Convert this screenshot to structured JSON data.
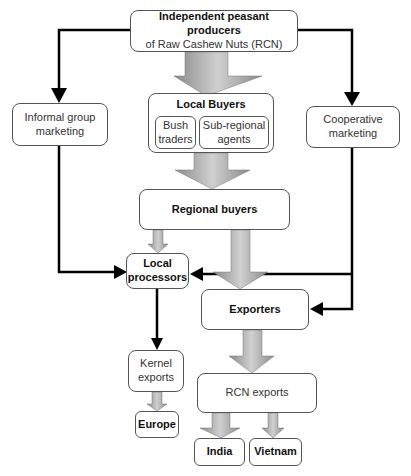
{
  "diagram": {
    "type": "flowchart",
    "nodes": {
      "producers": {
        "line1": "Independent peasant producers",
        "line2": "of Raw Cashew Nuts (RCN)"
      },
      "informal": {
        "label": "Informal group marketing"
      },
      "cooperative": {
        "label": "Cooperative marketing"
      },
      "local_buyers": {
        "label": "Local Buyers",
        "bush": "Bush traders",
        "subregional": "Sub-regional agents"
      },
      "regional_buyers": {
        "label": "Regional buyers"
      },
      "local_processors": {
        "label": "Local processors"
      },
      "exporters": {
        "label": "Exporters"
      },
      "kernel_exports": {
        "label": "Kernel exports"
      },
      "europe": {
        "label": "Europe"
      },
      "rcn_exports": {
        "label": "RCN exports"
      },
      "india": {
        "label": "India"
      },
      "vietnam": {
        "label": "Vietnam"
      }
    },
    "edges": [
      [
        "producers",
        "informal"
      ],
      [
        "producers",
        "cooperative"
      ],
      [
        "producers",
        "local_buyers"
      ],
      [
        "local_buyers",
        "regional_buyers"
      ],
      [
        "regional_buyers",
        "local_processors"
      ],
      [
        "regional_buyers",
        "exporters"
      ],
      [
        "informal",
        "local_processors"
      ],
      [
        "cooperative",
        "local_processors"
      ],
      [
        "cooperative",
        "exporters"
      ],
      [
        "local_processors",
        "kernel_exports"
      ],
      [
        "kernel_exports",
        "europe"
      ],
      [
        "exporters",
        "rcn_exports"
      ],
      [
        "rcn_exports",
        "india"
      ],
      [
        "rcn_exports",
        "vietnam"
      ]
    ]
  }
}
